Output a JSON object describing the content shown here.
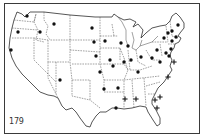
{
  "figure": {
    "number_label": "179"
  },
  "legend_symbols": {
    "dot": "solid-dot-marker",
    "cross": "plus-cross-marker"
  },
  "colors": {
    "ink": "#111111",
    "background": "#ffffff",
    "frame": "#3a3a3a"
  },
  "markers": [
    {
      "state": "WA",
      "symbol": "dot"
    },
    {
      "state": "OR",
      "symbol": "dot"
    },
    {
      "state": "ID",
      "symbol": "dot"
    },
    {
      "state": "MT",
      "symbol": "dot"
    },
    {
      "state": "CA",
      "symbol": "dot"
    },
    {
      "state": "ND",
      "symbol": "dot"
    },
    {
      "state": "SD",
      "symbol": "dot"
    },
    {
      "state": "NE",
      "symbol": "dot"
    },
    {
      "state": "KS",
      "symbol": "dot"
    },
    {
      "state": "TX-panhandle",
      "symbol": "dot"
    },
    {
      "state": "MN",
      "symbol": "dot"
    },
    {
      "state": "WI",
      "symbol": "dot"
    },
    {
      "state": "IA",
      "symbol": "dot"
    },
    {
      "state": "MI",
      "symbol": "dot"
    },
    {
      "state": "IL",
      "symbol": "dot"
    },
    {
      "state": "IN",
      "symbol": "dot"
    },
    {
      "state": "OH",
      "symbol": "dot"
    },
    {
      "state": "MO",
      "symbol": "dot"
    },
    {
      "state": "KY",
      "symbol": "dot"
    },
    {
      "state": "PA",
      "symbol": "dot"
    },
    {
      "state": "NY",
      "symbol": "dot"
    },
    {
      "state": "VT",
      "symbol": "dot"
    },
    {
      "state": "NH",
      "symbol": "dot"
    },
    {
      "state": "ME",
      "symbol": "dot"
    },
    {
      "state": "MA",
      "symbol": "dot"
    },
    {
      "state": "CT",
      "symbol": "dot"
    },
    {
      "state": "NJ",
      "symbol": "dot"
    },
    {
      "state": "DE",
      "symbol": "dot"
    },
    {
      "state": "MD",
      "symbol": "dot"
    },
    {
      "state": "WV",
      "symbol": "dot"
    },
    {
      "state": "VA",
      "symbol": "dot"
    },
    {
      "state": "LA",
      "symbol": "dot"
    },
    {
      "state": "AR",
      "symbol": "dot"
    },
    {
      "state": "OK",
      "symbol": "dot"
    },
    {
      "state": "NC",
      "symbol": "cross"
    },
    {
      "state": "SC",
      "symbol": "cross"
    },
    {
      "state": "GA",
      "symbol": "cross"
    },
    {
      "state": "AL",
      "symbol": "cross"
    },
    {
      "state": "MS",
      "symbol": "cross"
    },
    {
      "state": "FL",
      "symbol": "cross"
    },
    {
      "state": "DE-coast",
      "symbol": "cross"
    }
  ]
}
